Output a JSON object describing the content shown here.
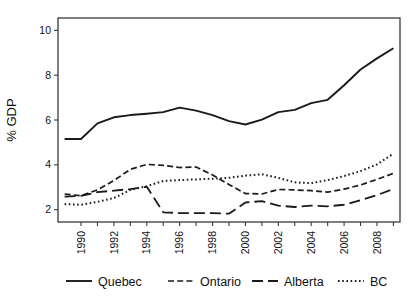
{
  "chart_data": {
    "type": "line",
    "title": "",
    "xlabel": "",
    "ylabel": "% GDP",
    "xlim": [
      1988.6,
      2009.4
    ],
    "ylim": [
      1.45,
      10.55
    ],
    "grid": false,
    "legend_position": "bottom",
    "y_ticks": [
      2,
      4,
      6,
      8,
      10
    ],
    "y_tick_labels": [
      "2",
      "4",
      "6",
      "8",
      "10"
    ],
    "x_ticks": [
      1990,
      1991,
      1992,
      1993,
      1994,
      1995,
      1996,
      1997,
      1998,
      1999,
      2000,
      2001,
      2002,
      2003,
      2004,
      2005,
      2006,
      2007,
      2008,
      2009
    ],
    "x_tick_labels": [
      "1990",
      "",
      "1992",
      "",
      "1994",
      "",
      "1996",
      "",
      "1998",
      "",
      "2000",
      "",
      "2002",
      "",
      "2004",
      "",
      "2006",
      "",
      "2008",
      ""
    ],
    "x": [
      1989,
      1990,
      1991,
      1992,
      1993,
      1994,
      1995,
      1996,
      1997,
      1998,
      1999,
      2000,
      2001,
      2002,
      2003,
      2004,
      2005,
      2006,
      2007,
      2008,
      2009
    ],
    "series": [
      {
        "name": "Quebec",
        "style": "solid",
        "color": "#1a1a1a",
        "values": [
          5.15,
          5.15,
          5.85,
          6.12,
          6.22,
          6.28,
          6.35,
          6.55,
          6.42,
          6.22,
          5.95,
          5.8,
          6.02,
          6.35,
          6.45,
          6.75,
          6.9,
          7.55,
          8.25,
          8.75,
          9.2
        ]
      },
      {
        "name": "Ontario",
        "style": "dashed",
        "color": "#1a1a1a",
        "values": [
          2.7,
          2.62,
          2.88,
          3.3,
          3.8,
          4.02,
          3.98,
          3.88,
          3.9,
          3.55,
          3.12,
          2.72,
          2.7,
          2.9,
          2.88,
          2.85,
          2.78,
          2.92,
          3.1,
          3.35,
          3.62
        ]
      },
      {
        "name": "Alberta",
        "style": "longdash",
        "color": "#1a1a1a",
        "values": [
          2.58,
          2.62,
          2.78,
          2.85,
          2.92,
          3.02,
          1.88,
          1.85,
          1.85,
          1.85,
          1.82,
          2.32,
          2.38,
          2.18,
          2.12,
          2.18,
          2.15,
          2.22,
          2.42,
          2.65,
          2.92
        ]
      },
      {
        "name": "BC",
        "style": "dotted",
        "color": "#1a1a1a",
        "values": [
          2.25,
          2.22,
          2.35,
          2.52,
          2.88,
          3.05,
          3.28,
          3.32,
          3.35,
          3.38,
          3.42,
          3.52,
          3.58,
          3.42,
          3.22,
          3.18,
          3.32,
          3.5,
          3.72,
          4.02,
          4.5
        ]
      }
    ],
    "legend": [
      {
        "label": "Quebec",
        "style": "solid"
      },
      {
        "label": "Ontario",
        "style": "dashed"
      },
      {
        "label": "Alberta",
        "style": "longdash"
      },
      {
        "label": "BC",
        "style": "dotted"
      }
    ]
  }
}
